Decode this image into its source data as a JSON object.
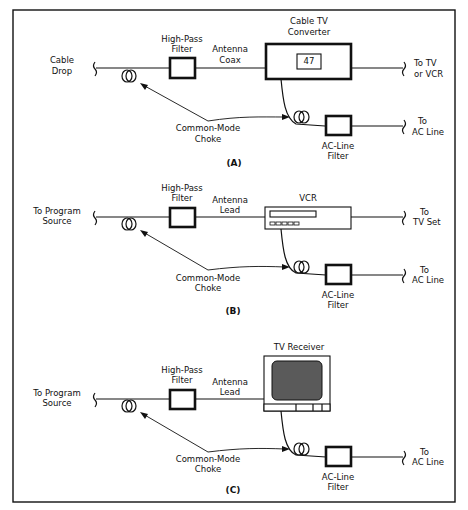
{
  "panels": [
    {
      "id": "A",
      "caption": "(A)",
      "source_label": [
        "Cable",
        "Drop"
      ],
      "filter_label": [
        "High-Pass",
        "Filter"
      ],
      "lead_label": [
        "Antenna",
        "Coax"
      ],
      "device_label": [
        "Cable TV",
        "Converter"
      ],
      "device_type": "cable-converter",
      "channel_display": "47",
      "output_label": [
        "To TV",
        "or VCR"
      ],
      "choke_label": [
        "Common-Mode",
        "Choke"
      ],
      "ac_filter_label": [
        "AC-Line",
        "Filter"
      ],
      "ac_output_label": [
        "To",
        "AC Line"
      ]
    },
    {
      "id": "B",
      "caption": "(B)",
      "source_label": [
        "To Program",
        "Source"
      ],
      "filter_label": [
        "High-Pass",
        "Filter"
      ],
      "lead_label": [
        "Antenna",
        "Lead"
      ],
      "device_label": [
        "VCR"
      ],
      "device_type": "vcr",
      "output_label": [
        "To",
        "TV Set"
      ],
      "choke_label": [
        "Common-Mode",
        "Choke"
      ],
      "ac_filter_label": [
        "AC-Line",
        "Filter"
      ],
      "ac_output_label": [
        "To",
        "AC Line"
      ]
    },
    {
      "id": "C",
      "caption": "(C)",
      "source_label": [
        "To Program",
        "Source"
      ],
      "filter_label": [
        "High-Pass",
        "Filter"
      ],
      "lead_label": [
        "Antenna",
        "Lead"
      ],
      "device_label": [
        "TV Receiver"
      ],
      "device_type": "tv-receiver",
      "choke_label": [
        "Common-Mode",
        "Choke"
      ],
      "ac_filter_label": [
        "AC-Line",
        "Filter"
      ],
      "ac_output_label": [
        "To",
        "AC Line"
      ]
    }
  ]
}
